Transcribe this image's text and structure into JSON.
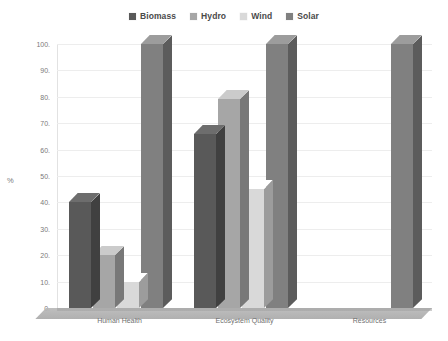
{
  "chart_data": {
    "type": "bar",
    "title": "",
    "xlabel": "",
    "ylabel": "%",
    "ylim": [
      0,
      100
    ],
    "ytick_values": [
      0,
      10,
      20,
      30,
      40,
      50,
      60,
      70,
      80,
      90,
      100
    ],
    "ytick_labels": [
      "0.",
      "10.",
      "20.",
      "30.",
      "40.",
      "50.",
      "60.",
      "70.",
      "80.",
      "90.",
      "100."
    ],
    "grid": true,
    "legend_position": "top-center",
    "style": "3d-clustered-column",
    "categories": [
      "Human Health",
      "Ecosystem Quality",
      "Resources"
    ],
    "series": [
      {
        "name": "Biomass",
        "color": "#595959",
        "values": [
          40,
          66,
          0
        ]
      },
      {
        "name": "Hydro",
        "color": "#a6a6a6",
        "values": [
          20,
          79,
          0
        ]
      },
      {
        "name": "Wind",
        "color": "#d9d9d9",
        "values": [
          10,
          45,
          0
        ]
      },
      {
        "name": "Solar",
        "color": "#808080",
        "values": [
          100,
          100,
          100
        ]
      }
    ]
  },
  "legend": {
    "items": [
      {
        "label": "Biomass",
        "swatch": "legend-swatch-biomass"
      },
      {
        "label": "Hydro",
        "swatch": "legend-swatch-hydro"
      },
      {
        "label": "Wind",
        "swatch": "legend-swatch-wind"
      },
      {
        "label": "Solar",
        "swatch": "legend-swatch-solar"
      }
    ]
  },
  "axes": {
    "y_title": "%"
  }
}
